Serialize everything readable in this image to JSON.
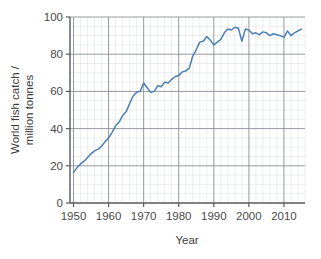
{
  "chart_data": {
    "type": "line",
    "title": "",
    "xlabel": "Year",
    "ylabel": "World fish catch / million tonnes",
    "ylabel_line1": "World fish catch /",
    "ylabel_line2": "million tonnes",
    "xlim": [
      1949,
      2016
    ],
    "ylim": [
      0,
      100
    ],
    "xticks": [
      1950,
      1960,
      1970,
      1980,
      1990,
      2000,
      2010
    ],
    "xtick_labels": [
      "1950",
      "1960",
      "1970",
      "1980",
      "1990",
      "2000",
      "2010"
    ],
    "yticks": [
      0,
      20,
      40,
      60,
      80,
      100
    ],
    "ytick_labels": [
      "0",
      "20",
      "40",
      "60",
      "80",
      "100"
    ],
    "x_minor_step": 2,
    "y_minor_step": 5,
    "grid": true,
    "legend": false,
    "series": [
      {
        "name": "World fish catch",
        "color": "#4a7fb5",
        "x": [
          1950,
          1951,
          1952,
          1953,
          1954,
          1955,
          1956,
          1957,
          1958,
          1959,
          1960,
          1961,
          1962,
          1963,
          1964,
          1965,
          1966,
          1967,
          1968,
          1969,
          1970,
          1971,
          1972,
          1973,
          1974,
          1975,
          1976,
          1977,
          1978,
          1979,
          1980,
          1981,
          1982,
          1983,
          1984,
          1985,
          1986,
          1987,
          1988,
          1989,
          1990,
          1991,
          1992,
          1993,
          1994,
          1995,
          1996,
          1997,
          1998,
          1999,
          2000,
          2001,
          2002,
          2003,
          2004,
          2005,
          2006,
          2007,
          2008,
          2009,
          2010,
          2011,
          2012,
          2013,
          2014,
          2015
        ],
        "values": [
          16.5,
          19.0,
          21.0,
          22.5,
          24.5,
          26.5,
          28.0,
          29.0,
          30.5,
          33.0,
          35.0,
          38.0,
          41.5,
          43.5,
          47.0,
          49.0,
          53.5,
          57.5,
          59.5,
          60.0,
          64.5,
          62.0,
          59.5,
          60.0,
          63.0,
          62.5,
          65.0,
          64.5,
          66.5,
          68.0,
          68.5,
          70.5,
          71.0,
          72.5,
          79.0,
          82.5,
          86.5,
          87.0,
          89.5,
          87.5,
          85.0,
          86.5,
          88.0,
          91.5,
          93.5,
          93.0,
          94.5,
          94.0,
          87.0,
          93.5,
          93.0,
          91.0,
          91.5,
          90.5,
          92.0,
          91.5,
          90.0,
          91.0,
          90.5,
          90.0,
          89.0,
          92.5,
          90.0,
          91.5,
          92.5,
          93.5
        ]
      }
    ]
  },
  "axis": {
    "x_title": "Year",
    "y_title_line1": "World fish catch /",
    "y_title_line2": "million tonnes"
  },
  "colors": {
    "series": "#4a7fb5",
    "grid_minor": "#d9dde3",
    "grid_major": "#8a8f96",
    "axis": "#58595b",
    "text": "#4a4a4a",
    "background": "#ffffff"
  }
}
